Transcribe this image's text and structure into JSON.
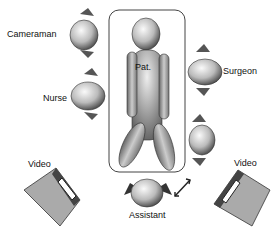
{
  "diagram": {
    "patient_label": "Pat.",
    "people": [
      {
        "role": "cameraman",
        "label": "Cameraman"
      },
      {
        "role": "nurse",
        "label": "Nurse"
      },
      {
        "role": "surgeon",
        "label": "Surgeon"
      },
      {
        "role": "assistant",
        "label": "Assistant"
      }
    ],
    "monitors": [
      {
        "position": "left",
        "label": "Video"
      },
      {
        "position": "right",
        "label": "Video"
      }
    ],
    "signature": "signature (illegible handwriting)"
  }
}
